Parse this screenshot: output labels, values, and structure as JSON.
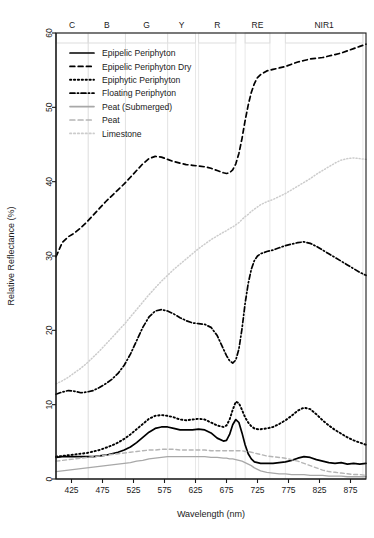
{
  "chart_data": {
    "type": "line",
    "title": "",
    "xlabel": "Wavelength (nm)",
    "ylabel": "Relative Reflectance (%)",
    "xlim": [
      400,
      900
    ],
    "ylim": [
      0,
      60
    ],
    "xticks": [
      425,
      475,
      525,
      575,
      625,
      675,
      725,
      775,
      825,
      875
    ],
    "yticks": [
      0,
      10,
      20,
      30,
      40,
      50,
      60
    ],
    "grid": false,
    "legend_position": "top-left",
    "bands": [
      {
        "label": "C",
        "start": 400,
        "end": 452
      },
      {
        "label": "B",
        "start": 452,
        "end": 512
      },
      {
        "label": "G",
        "start": 512,
        "end": 580
      },
      {
        "label": "Y",
        "start": 580,
        "end": 625
      },
      {
        "label": "R",
        "start": 630,
        "end": 690
      },
      {
        "label": "RE",
        "start": 705,
        "end": 745
      },
      {
        "label": "NIR1",
        "start": 770,
        "end": 895
      }
    ],
    "x": [
      400,
      410,
      420,
      430,
      440,
      450,
      460,
      470,
      480,
      490,
      500,
      510,
      520,
      530,
      540,
      550,
      560,
      570,
      580,
      590,
      600,
      610,
      620,
      630,
      640,
      650,
      660,
      670,
      675,
      680,
      685,
      690,
      695,
      700,
      705,
      710,
      715,
      720,
      725,
      730,
      740,
      750,
      760,
      770,
      780,
      790,
      800,
      810,
      820,
      830,
      840,
      850,
      860,
      870,
      880,
      890,
      900
    ],
    "series": [
      {
        "name": "Epipelic Periphyton",
        "style": "solid",
        "color": "#000000",
        "width": 1.7,
        "values": [
          2.9,
          3.0,
          3.0,
          3.0,
          3.0,
          3.0,
          3.0,
          3.1,
          3.2,
          3.4,
          3.6,
          3.9,
          4.3,
          4.9,
          5.6,
          6.3,
          6.8,
          7.0,
          7.0,
          6.8,
          6.6,
          6.6,
          6.6,
          6.7,
          6.6,
          6.2,
          5.5,
          5.1,
          5.2,
          6.0,
          7.3,
          8.0,
          7.6,
          6.2,
          4.6,
          3.4,
          2.7,
          2.3,
          2.2,
          2.1,
          2.1,
          2.1,
          2.2,
          2.3,
          2.5,
          2.8,
          3.0,
          2.9,
          2.6,
          2.4,
          2.2,
          2.1,
          2.2,
          2.0,
          2.1,
          2.0,
          2.1
        ]
      },
      {
        "name": "Epipelic Periphyton Dry",
        "style": "dashed",
        "color": "#000000",
        "width": 1.7,
        "values": [
          29.9,
          31.8,
          32.6,
          33.1,
          33.8,
          34.6,
          35.5,
          36.4,
          37.3,
          38.1,
          38.9,
          39.7,
          40.6,
          41.5,
          42.4,
          43.1,
          43.4,
          43.3,
          43.0,
          42.7,
          42.5,
          42.3,
          42.2,
          42.1,
          42.0,
          41.8,
          41.5,
          41.2,
          41.1,
          41.2,
          41.6,
          42.4,
          43.8,
          45.8,
          48.2,
          50.3,
          52.0,
          53.2,
          54.0,
          54.4,
          54.9,
          55.1,
          55.3,
          55.5,
          55.8,
          56.1,
          56.3,
          56.5,
          56.6,
          56.7,
          56.9,
          57.1,
          57.3,
          57.6,
          57.9,
          58.2,
          58.5
        ]
      },
      {
        "name": "Epiphytic Periphyton",
        "style": "dotted",
        "color": "#000000",
        "width": 1.9,
        "values": [
          3.0,
          3.1,
          3.2,
          3.3,
          3.4,
          3.5,
          3.7,
          3.9,
          4.2,
          4.5,
          4.9,
          5.4,
          6.0,
          6.7,
          7.4,
          8.1,
          8.5,
          8.6,
          8.5,
          8.3,
          8.0,
          7.9,
          8.0,
          8.1,
          8.0,
          7.6,
          7.2,
          7.0,
          7.2,
          8.0,
          9.3,
          10.4,
          10.2,
          9.3,
          8.3,
          7.6,
          7.1,
          6.8,
          6.7,
          6.7,
          6.8,
          7.0,
          7.4,
          7.9,
          8.5,
          9.2,
          9.6,
          9.4,
          8.7,
          7.9,
          7.2,
          6.6,
          6.1,
          5.6,
          5.2,
          4.9,
          4.6
        ]
      },
      {
        "name": "Floating Periphyton",
        "style": "dashdot",
        "color": "#000000",
        "width": 1.7,
        "values": [
          11.4,
          11.7,
          11.9,
          11.8,
          11.6,
          11.7,
          11.9,
          12.3,
          12.8,
          13.4,
          14.2,
          15.3,
          16.8,
          18.6,
          20.4,
          21.8,
          22.6,
          22.8,
          22.6,
          22.2,
          21.7,
          21.3,
          21.0,
          20.9,
          20.8,
          20.4,
          19.3,
          17.5,
          16.6,
          15.9,
          15.6,
          16.0,
          17.5,
          20.2,
          23.6,
          26.3,
          28.2,
          29.4,
          30.0,
          30.3,
          30.6,
          30.8,
          31.1,
          31.4,
          31.6,
          31.8,
          31.9,
          31.7,
          31.3,
          30.8,
          30.3,
          29.8,
          29.3,
          28.8,
          28.3,
          27.8,
          27.4
        ]
      },
      {
        "name": "Peat (Submerged)",
        "style": "solid",
        "color": "#a8a8a8",
        "width": 1.3,
        "values": [
          1.0,
          1.1,
          1.2,
          1.3,
          1.4,
          1.5,
          1.6,
          1.7,
          1.8,
          1.9,
          2.0,
          2.1,
          2.2,
          2.4,
          2.5,
          2.7,
          2.8,
          2.9,
          3.0,
          3.0,
          3.0,
          3.0,
          3.0,
          3.0,
          3.0,
          2.9,
          2.9,
          2.8,
          2.8,
          2.7,
          2.7,
          2.6,
          2.5,
          2.4,
          2.2,
          2.0,
          1.8,
          1.5,
          1.3,
          1.1,
          0.9,
          0.8,
          0.7,
          0.7,
          0.6,
          0.6,
          0.6,
          0.5,
          0.5,
          0.5,
          0.4,
          0.4,
          0.4,
          0.3,
          0.3,
          0.3,
          0.3
        ]
      },
      {
        "name": "Peat",
        "style": "dashed",
        "color": "#b5b5b5",
        "width": 1.4,
        "values": [
          2.4,
          2.5,
          2.6,
          2.7,
          2.8,
          2.9,
          3.0,
          3.1,
          3.2,
          3.3,
          3.4,
          3.5,
          3.6,
          3.7,
          3.8,
          3.9,
          3.9,
          4.0,
          4.0,
          4.0,
          3.9,
          3.9,
          3.9,
          3.9,
          3.9,
          3.8,
          3.8,
          3.8,
          3.8,
          3.8,
          3.8,
          3.8,
          3.8,
          3.8,
          3.7,
          3.7,
          3.6,
          3.5,
          3.4,
          3.3,
          3.1,
          3.0,
          2.9,
          2.8,
          2.6,
          2.4,
          2.1,
          1.8,
          1.5,
          1.2,
          1.0,
          0.9,
          0.8,
          0.7,
          0.6,
          0.6,
          0.5
        ]
      },
      {
        "name": "Limestone",
        "style": "dotted",
        "color": "#cccccc",
        "width": 1.5,
        "values": [
          12.8,
          13.2,
          13.7,
          14.3,
          14.9,
          15.6,
          16.4,
          17.2,
          18.1,
          19.0,
          19.9,
          20.8,
          21.8,
          22.8,
          23.8,
          24.8,
          25.7,
          26.6,
          27.4,
          28.2,
          28.9,
          29.6,
          30.3,
          31.0,
          31.6,
          32.2,
          32.7,
          33.2,
          33.4,
          33.7,
          33.9,
          34.2,
          34.5,
          34.9,
          35.3,
          35.6,
          36.0,
          36.3,
          36.6,
          36.9,
          37.3,
          37.6,
          38.0,
          38.4,
          38.9,
          39.4,
          39.9,
          40.4,
          41.0,
          41.5,
          42.0,
          42.5,
          42.9,
          43.1,
          43.2,
          43.1,
          43.0
        ]
      }
    ]
  },
  "legend": {
    "items": [
      {
        "label": "Epipelic Periphyton",
        "style": "solid",
        "color": "#000000"
      },
      {
        "label": "Epipelic Periphyton Dry",
        "style": "dashed",
        "color": "#000000"
      },
      {
        "label": "Epiphytic Periphyton",
        "style": "dotted",
        "color": "#000000"
      },
      {
        "label": "Floating Periphyton",
        "style": "dashdot",
        "color": "#000000"
      },
      {
        "label": "Peat (Submerged)",
        "style": "solid",
        "color": "#a8a8a8"
      },
      {
        "label": "Peat",
        "style": "dashed",
        "color": "#b5b5b5"
      },
      {
        "label": "Limestone",
        "style": "dotted",
        "color": "#cccccc"
      }
    ]
  }
}
